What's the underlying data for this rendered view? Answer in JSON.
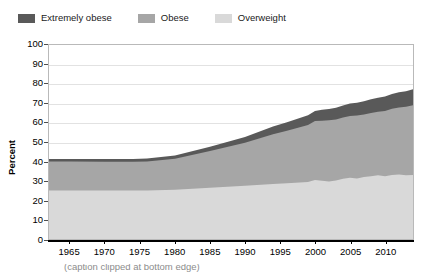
{
  "legend": {
    "position": "top-left",
    "items": [
      {
        "label": "Extremely obese",
        "color": "#595959",
        "icon": "legend-swatch"
      },
      {
        "label": "Obese",
        "color": "#a6a6a6",
        "icon": "legend-swatch"
      },
      {
        "label": "Overweight",
        "color": "#d9d9d9",
        "icon": "legend-swatch"
      }
    ]
  },
  "axes": {
    "y_title": "Percent",
    "y_ticks": [
      "0",
      "10",
      "20",
      "30",
      "40",
      "50",
      "60",
      "70",
      "80",
      "90",
      "100"
    ],
    "x_ticks": [
      "1965",
      "1970",
      "1975",
      "1980",
      "1985",
      "1990",
      "1995",
      "2000",
      "2005",
      "2010"
    ]
  },
  "caption": {
    "text": "(caption clipped at bottom edge)"
  },
  "chart_data": {
    "type": "area",
    "stacked": true,
    "title": "",
    "xlabel": "",
    "ylabel": "Percent",
    "xlim": [
      1962,
      2014
    ],
    "ylim": [
      0,
      100
    ],
    "ytick_step": 10,
    "grid": true,
    "legend_position": "top-left",
    "x": [
      1962,
      1965,
      1970,
      1974,
      1976,
      1980,
      1985,
      1990,
      1994,
      1996,
      1999,
      2000,
      2001,
      2002,
      2003,
      2004,
      2005,
      2006,
      2007,
      2008,
      2009,
      2010,
      2011,
      2012,
      2013,
      2014
    ],
    "series": [
      {
        "name": "Overweight",
        "color": "#d9d9d9",
        "values": [
          25.0,
          25.0,
          25.0,
          25.0,
          25.0,
          25.4,
          26.4,
          27.4,
          28.4,
          28.8,
          29.4,
          30.4,
          30.0,
          29.6,
          30.2,
          31.0,
          31.6,
          31.2,
          32.0,
          32.4,
          32.8,
          32.4,
          33.0,
          33.2,
          32.8,
          33.0
        ]
      },
      {
        "name": "Obese",
        "color": "#a6a6a6",
        "values": [
          15.0,
          15.0,
          14.8,
          14.8,
          15.0,
          16.0,
          19.0,
          22.2,
          25.6,
          27.0,
          29.4,
          30.4,
          31.0,
          31.6,
          31.4,
          31.6,
          31.8,
          32.4,
          32.2,
          32.6,
          32.8,
          33.6,
          34.2,
          34.6,
          35.4,
          36.0
        ]
      },
      {
        "name": "Extremely obese",
        "color": "#595959",
        "values": [
          1.3,
          1.3,
          1.4,
          1.5,
          1.5,
          1.6,
          2.2,
          3.0,
          4.0,
          4.4,
          5.0,
          5.2,
          5.6,
          5.8,
          6.0,
          6.2,
          6.4,
          6.6,
          6.8,
          7.0,
          7.2,
          7.4,
          7.6,
          7.8,
          8.0,
          8.2
        ]
      }
    ],
    "totals": [
      41.3,
      41.3,
      41.2,
      41.3,
      41.5,
      43.0,
      47.6,
      52.6,
      58.0,
      60.2,
      63.8,
      66.0,
      66.6,
      67.0,
      67.6,
      68.8,
      69.8,
      70.2,
      71.0,
      72.0,
      72.8,
      73.4,
      74.8,
      75.6,
      76.2,
      77.2
    ]
  }
}
